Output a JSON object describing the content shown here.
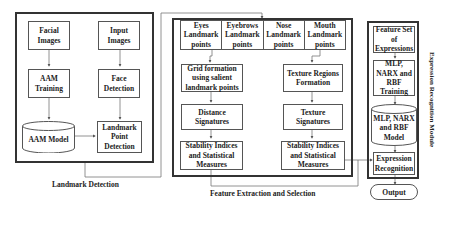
{
  "landmark_detection": {
    "title": "Landmark Detection",
    "facial_images": "Facial Images",
    "input_images": "Input Images",
    "aam_training": "AAM Training",
    "face_detection": "Face Detection",
    "aam_model": "AAM Model",
    "landmark_point_detection": "Landmark Point Detection"
  },
  "feature_extraction": {
    "title": "Feature Extraction and Selection",
    "landmark_groups": [
      {
        "label": "Eyes Landmark points"
      },
      {
        "label": "Eyebrows Landmark points"
      },
      {
        "label": "Nose Landmark points"
      },
      {
        "label": "Mouth Landmark points"
      }
    ],
    "grid_formation": "Grid formation using salient landmark points",
    "distance_signatures": "Distance Signatures",
    "stability_left": "Stability Indices and Statistical Measures",
    "texture_regions": "Texture Regions Formation",
    "texture_signatures": "Texture Signatures",
    "stability_right": "Stability Indices and Statistical Measures"
  },
  "expression_module": {
    "title": "Expression Recognition Module",
    "feature_set": "Feature Set of Expressions",
    "training": "MLP, NARX and RBF Training",
    "model": "MLP, NARX and RBF Model",
    "recognition": "Expression Recognition"
  },
  "output": "Output"
}
